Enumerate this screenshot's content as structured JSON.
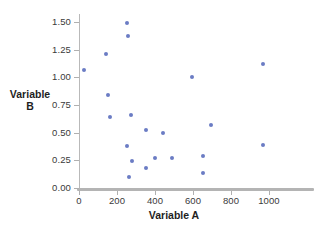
{
  "chart_data": {
    "type": "scatter",
    "title": "",
    "xlabel": "Variable A",
    "ylabel_line1": "Variable",
    "ylabel_line2": "B",
    "ylabel": "Variable B",
    "xlim": [
      0,
      1060
    ],
    "ylim": [
      0.0,
      1.57
    ],
    "xticks": [
      0,
      200,
      400,
      600,
      800,
      1000
    ],
    "xtick_labels": [
      "0",
      "200",
      "400",
      "600",
      "800",
      "1000"
    ],
    "yticks": [
      0.0,
      0.25,
      0.5,
      0.75,
      1.0,
      1.25,
      1.5
    ],
    "ytick_labels": [
      "0.00",
      "0.25",
      "0.50",
      "0.75",
      "1.00",
      "1.25",
      "1.50"
    ],
    "grid": false,
    "legend": false,
    "marker_color": "#6b7cc4",
    "axis_color": "#b4b4b4",
    "background": "#ffffff",
    "series": [
      {
        "name": "data",
        "points": [
          [
            25,
            1.07
          ],
          [
            140,
            1.21
          ],
          [
            150,
            0.84
          ],
          [
            165,
            0.64
          ],
          [
            250,
            1.49
          ],
          [
            258,
            1.37
          ],
          [
            250,
            0.38
          ],
          [
            265,
            0.1
          ],
          [
            275,
            0.66
          ],
          [
            278,
            0.24
          ],
          [
            350,
            0.52
          ],
          [
            355,
            0.18
          ],
          [
            400,
            0.27
          ],
          [
            440,
            0.5
          ],
          [
            490,
            0.27
          ],
          [
            595,
            1.0
          ],
          [
            650,
            0.29
          ],
          [
            650,
            0.14
          ],
          [
            695,
            0.57
          ],
          [
            970,
            1.12
          ],
          [
            970,
            0.39
          ]
        ]
      }
    ]
  }
}
